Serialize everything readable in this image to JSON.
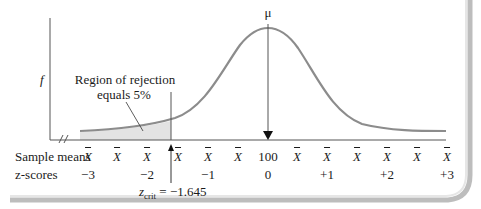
{
  "diagram": {
    "y_axis_label": "f",
    "mu_label": "μ",
    "region_label_line1": "Region of rejection",
    "region_label_line2": "equals 5%",
    "critical_label_prefix": "z",
    "critical_label_sub": "crit",
    "critical_label_value": " = −1.645",
    "row_labels": {
      "sample_means": "Sample means",
      "z_scores": "z-scores"
    },
    "sample_means": [
      {
        "text": "X",
        "bar": true,
        "x": 88
      },
      {
        "text": "X",
        "bar": true,
        "x": 117
      },
      {
        "text": "X",
        "bar": true,
        "x": 147
      },
      {
        "text": "X",
        "bar": true,
        "x": 178
      },
      {
        "text": "X",
        "bar": true,
        "x": 208
      },
      {
        "text": "X",
        "bar": true,
        "x": 238
      },
      {
        "text": "100",
        "bar": false,
        "x": 268
      },
      {
        "text": "X",
        "bar": true,
        "x": 297
      },
      {
        "text": "X",
        "bar": true,
        "x": 327
      },
      {
        "text": "X",
        "bar": true,
        "x": 357
      },
      {
        "text": "X",
        "bar": true,
        "x": 387
      },
      {
        "text": "X",
        "bar": true,
        "x": 417
      },
      {
        "text": "X",
        "bar": true,
        "x": 447
      }
    ],
    "z_scores": [
      {
        "text": "−3",
        "x": 88
      },
      {
        "text": "−2",
        "x": 147
      },
      {
        "text": "−1",
        "x": 208
      },
      {
        "text": "0",
        "x": 268
      },
      {
        "text": "+1",
        "x": 327
      },
      {
        "text": "+2",
        "x": 387
      },
      {
        "text": "+3",
        "x": 447
      }
    ],
    "colors": {
      "curve": "#8c8c8c",
      "shade": "#e3e3e3",
      "axis": "#555555",
      "text": "#1a1a1a"
    }
  },
  "chart_data": {
    "type": "area",
    "title": "",
    "xlabel": "Sample means / z-scores",
    "ylabel": "f",
    "mean": 100,
    "z_ticks": [
      -3,
      -2,
      -1,
      0,
      1,
      2,
      3
    ],
    "critical_z": -1.645,
    "alpha": 0.05,
    "tail": "left",
    "annotations": [
      "μ",
      "Region of rejection equals 5%",
      "z_crit = −1.645"
    ]
  }
}
